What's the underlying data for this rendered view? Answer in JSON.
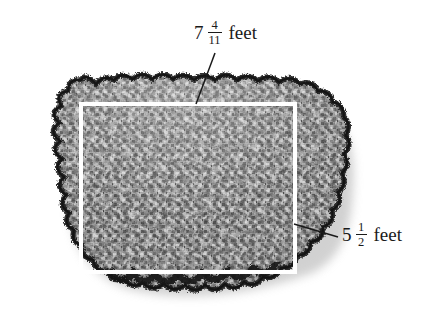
{
  "figure": {
    "type": "geometry-diagram",
    "background_color": "#ffffff",
    "width": 431,
    "height": 315
  },
  "rectangle": {
    "name": "measured-rectangle",
    "stroke_color": "#ffffff",
    "stroke_width": 4,
    "left": 81,
    "top": 104,
    "right": 295,
    "bottom": 272
  },
  "rock": {
    "name": "gravel-rock-mass",
    "fill_dark": "#3a3a3a",
    "fill_mid": "#8a8a8a",
    "fill_light": "#c8c8c8",
    "edge_color": "#1c1c1c",
    "shadow_color": "#b9b9b9"
  },
  "labels": {
    "top": {
      "id": "length-label",
      "whole": "7",
      "numerator": "4",
      "denominator": "11",
      "unit": "feet",
      "full_text": "7 4/11 feet",
      "color": "#1a1a1a"
    },
    "right": {
      "id": "width-label",
      "whole": "5",
      "numerator": "1",
      "denominator": "2",
      "unit": "feet",
      "full_text": "5 1/2 feet",
      "color": "#1a1a1a"
    }
  },
  "leader_lines": [
    {
      "id": "leader-top",
      "x1": 215,
      "y1": 53,
      "x2": 196,
      "y2": 104,
      "color": "#1a1a1a"
    },
    {
      "id": "leader-right",
      "x1": 338,
      "y1": 237,
      "x2": 294,
      "y2": 224,
      "color": "#1a1a1a"
    }
  ]
}
